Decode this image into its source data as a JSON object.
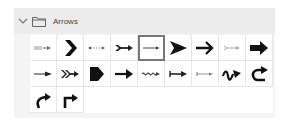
{
  "group": {
    "title": "Arrows",
    "expanded": true,
    "chevron_icon": "chevron-down-icon",
    "folder_icon": "folder-icon"
  },
  "selected_index": 4,
  "arrows": [
    {
      "name": "striped-tail-arrow"
    },
    {
      "name": "chevron-bold-arrow"
    },
    {
      "name": "dotted-line-arrow"
    },
    {
      "name": "feathered-arrow"
    },
    {
      "name": "thin-line-arrow"
    },
    {
      "name": "notched-triangle-arrow"
    },
    {
      "name": "open-head-bold-arrow"
    },
    {
      "name": "light-gray-arrow"
    },
    {
      "name": "block-arrow"
    },
    {
      "name": "tapered-arrow"
    },
    {
      "name": "double-feather-arrow"
    },
    {
      "name": "pentagon-arrow"
    },
    {
      "name": "bold-line-arrow"
    },
    {
      "name": "wavy-arrow"
    },
    {
      "name": "bar-tail-arrow"
    },
    {
      "name": "thin-bar-tail-arrow"
    },
    {
      "name": "squiggle-arrow"
    },
    {
      "name": "u-turn-arrow"
    },
    {
      "name": "curved-up-arrow"
    },
    {
      "name": "right-angle-arrow"
    }
  ]
}
